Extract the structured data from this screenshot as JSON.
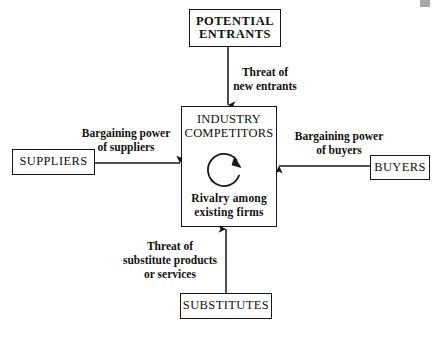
{
  "diagram": {
    "boxes": {
      "potential_entrants": "POTENTIAL\nENTRANTS",
      "potential_entrants_line1": "POTENTIAL",
      "potential_entrants_line2": "ENTRANTS",
      "industry_competitors_line1": "INDUSTRY",
      "industry_competitors_line2": "COMPETITORS",
      "rivalry_line1": "Rivalry among",
      "rivalry_line2": "existing firms",
      "suppliers": "SUPPLIERS",
      "buyers": "BUYERS",
      "substitutes": "SUBSTITUTES"
    },
    "connector_labels": {
      "threat_of_new_entrants": "Threat of\nnew entrants",
      "bargaining_power_of_suppliers": "Bargaining power\nof suppliers",
      "bargaining_power_of_buyers": "Bargaining power\nof buyers",
      "threat_of_substitutes": "Threat of\nsubstitute products\nor services"
    },
    "colors": {
      "stroke": "#161616",
      "text": "#111111",
      "background": "#ffffff",
      "artifact": "#a8a8a8"
    }
  }
}
